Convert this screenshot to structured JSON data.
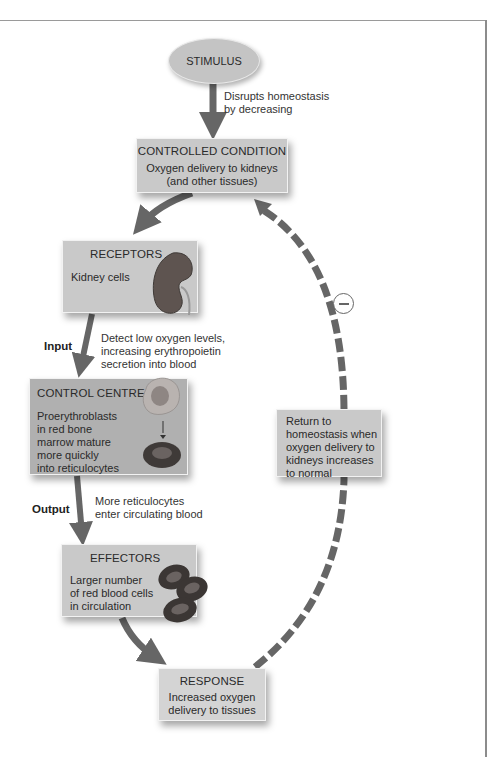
{
  "diagram": {
    "type": "negative-feedback-loop",
    "stimulus": {
      "label": "STIMULUS"
    },
    "stimulus_arrow_label": [
      "Disrupts homeostasis",
      "by decreasing"
    ],
    "controlled_condition": {
      "title": "CONTROLLED CONDITION",
      "lines": [
        "Oxygen delivery to kidneys",
        "(and other tissues)"
      ]
    },
    "receptors": {
      "title": "RECEPTORS",
      "body": "Kidney cells",
      "icon": "kidney-icon"
    },
    "input": {
      "label": "Input",
      "description": [
        "Detect low oxygen levels,",
        "increasing erythropoietin",
        "secretion into blood"
      ]
    },
    "control_centre": {
      "title": "CONTROL CENTRE",
      "lines": [
        "Proerythroblasts",
        "in red bone",
        "marrow mature",
        "more quickly",
        "into reticulocytes"
      ],
      "icons": [
        "proerythroblast-cell-icon",
        "red-blood-cell-icon"
      ]
    },
    "output": {
      "label": "Output",
      "description": [
        "More reticulocytes",
        "enter circulating blood"
      ]
    },
    "effectors": {
      "title": "EFFECTORS",
      "lines": [
        "Larger number",
        "of red blood cells",
        "in circulation"
      ],
      "icon": "red-blood-cells-icon"
    },
    "response": {
      "title": "RESPONSE",
      "lines": [
        "Increased oxygen",
        "delivery to tissues"
      ]
    },
    "return": {
      "lines": [
        "Return to",
        "homeostasis when",
        "oxygen delivery to",
        "kidneys increases",
        "to normal"
      ],
      "symbol": "minus"
    },
    "colors": {
      "arrow": "#666666",
      "box": "#c9c9c9",
      "box_dark": "#b0b0b0",
      "box_light": "#d4d4d4"
    }
  }
}
